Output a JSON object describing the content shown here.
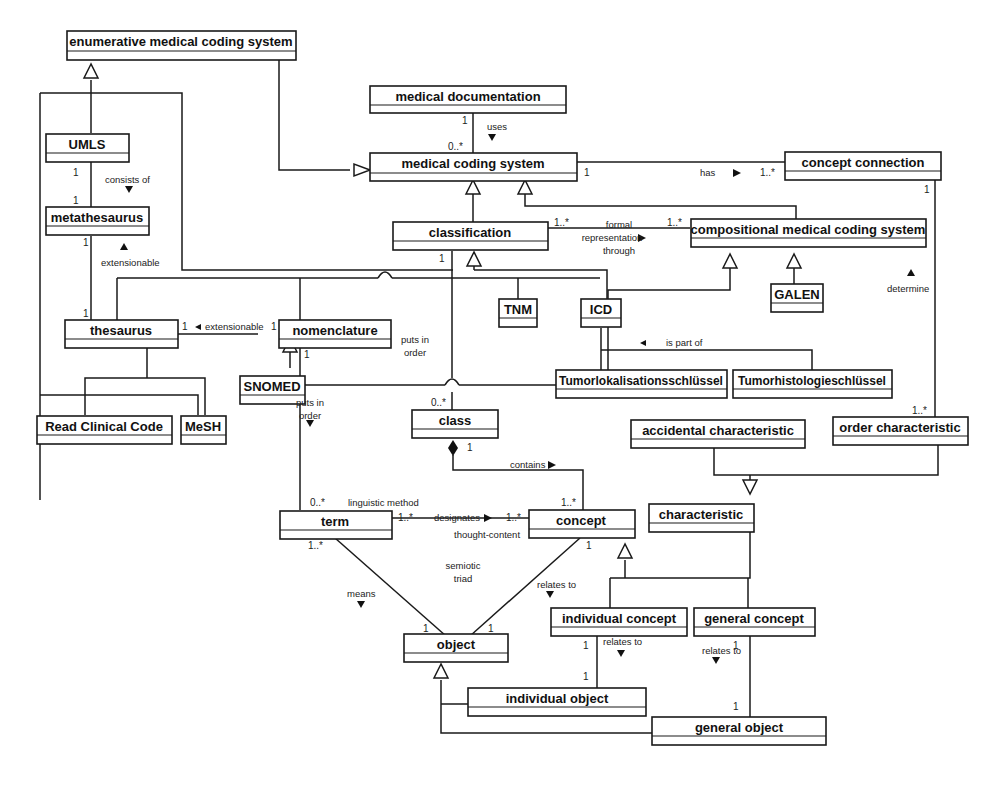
{
  "diagram": {
    "type": "UML class diagram",
    "classes": {
      "enumerative": "enumerative medical coding system",
      "med_doc": "medical documentation",
      "mcs": "medical coding system",
      "concept_connection": "concept connection",
      "umls": "UMLS",
      "metathesaurus": "metathesaurus",
      "classification": "classification",
      "compositional": "compositional medical coding system",
      "galen": "GALEN",
      "thesaurus": "thesaurus",
      "nomenclature": "nomenclature",
      "tnm": "TNM",
      "icd": "ICD",
      "snomed": "SNOMED",
      "tumorlok": "Tumorlokalisationsschlüssel",
      "tumorhist": "Tumorhistologieschlüssel",
      "read": "Read Clinical Code",
      "mesh": "MeSH",
      "class": "class",
      "accidental": "accidental characteristic",
      "order": "order characteristic",
      "characteristic": "characteristic",
      "term": "term",
      "concept": "concept",
      "object": "object",
      "individual_concept": "individual concept",
      "general_concept": "general concept",
      "individual_object": "individual object",
      "general_object": "general object"
    },
    "labels": {
      "uses": "uses",
      "has": "has",
      "consists_of": "consists of",
      "extensionable_meta": "extensionable",
      "formal1": "formal",
      "formal2": "representation",
      "formal3": "through",
      "determine": "determine",
      "extensionable_thes": "extensionable",
      "puts_in_order_class1": "puts in",
      "puts_in_order_class2": "order",
      "is_part_of": "is part of",
      "puts_in_order_nom1": "puts in",
      "puts_in_order_nom2": "order",
      "contains": "contains",
      "linguistic_method": "linguistic method",
      "designates": "designates",
      "thought_content": "thought-content",
      "semiotic1": "semiotic",
      "semiotic2": "triad",
      "means": "means",
      "relates_to_concept": "relates to",
      "relates_to_ind": "relates to",
      "relates_to_gen": "relates to"
    },
    "multiplicities": {
      "meddoc_1": "1",
      "mcs_0n": "0..*",
      "mcs_has_1": "1",
      "cc_has_1n": "1..*",
      "umls_1": "1",
      "meta_top_1": "1",
      "meta_bot_1": "1",
      "thes_top_1": "1",
      "class_formal_1n": "1..*",
      "comp_formal_1n": "1..*",
      "cc_det_1": "1",
      "classif_1": "1",
      "thes_ext_1": "1",
      "nom_ext_1": "1",
      "nom_bot_1": "1",
      "class_0n": "0..*",
      "order_1n": "1..*",
      "class_dia_1": "1",
      "term_0n": "0..*",
      "concept_top_1n": "1..*",
      "term_des_1n": "1..*",
      "concept_des_1n": "1..*",
      "term_bot_1n": "1..*",
      "concept_bot_1": "1",
      "object_l_1": "1",
      "object_r_1": "1",
      "indc_1": "1",
      "indo_1": "1",
      "genc_1": "1",
      "geno_1": "1"
    }
  }
}
